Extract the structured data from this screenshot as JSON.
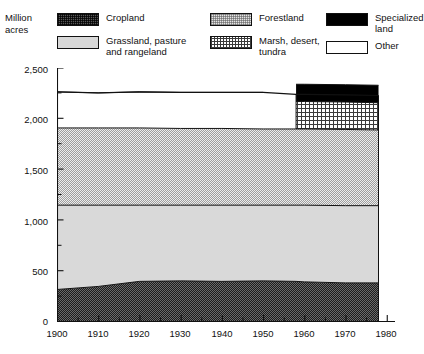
{
  "axis": {
    "unit_label": "Million\nacres",
    "y_ticks": [
      "2,500",
      "2,000",
      "1,500",
      "1,000",
      "500",
      "0"
    ],
    "x_ticks": [
      "1900",
      "1910",
      "1920",
      "1930",
      "1940",
      "1950",
      "1960",
      "1970",
      "1980"
    ]
  },
  "legend": {
    "items": [
      {
        "key": "cropland",
        "label": "Cropland",
        "swatch": "cropland-swatch"
      },
      {
        "key": "grassland",
        "label": "Grassland, pasture\nand rangeland",
        "swatch": "grassland-swatch"
      },
      {
        "key": "forestland",
        "label": "Forestland",
        "swatch": "forestland-swatch"
      },
      {
        "key": "marsh",
        "label": "Marsh, desert,\ntundra",
        "swatch": "marsh-swatch"
      },
      {
        "key": "specialized",
        "label": "Specialized\nland",
        "swatch": "specialized-land-swatch"
      },
      {
        "key": "other",
        "label": "Other",
        "swatch": "other-swatch"
      }
    ]
  },
  "colors": {
    "cropland": "#585858",
    "grassland": "#d8d8d8",
    "forestland": "#e4e4e4",
    "marsh": "#ffffff",
    "specialized": "#000000",
    "other": "#ffffff",
    "axis": "#111111"
  },
  "chart_data": {
    "type": "area",
    "title": "",
    "xlabel": "",
    "ylabel": "Million acres",
    "xlim": [
      1900,
      1982
    ],
    "ylim": [
      0,
      2500
    ],
    "ytick_values": [
      0,
      500,
      1000,
      1500,
      2000,
      2500
    ],
    "ytick_minor_step": 250,
    "xtick_values": [
      1900,
      1910,
      1920,
      1930,
      1940,
      1950,
      1960,
      1970,
      1980
    ],
    "xtick_minor_step": 5,
    "grid": false,
    "legend_position": "top",
    "stacking": "bottom-up",
    "data_end_year": 1978,
    "x": [
      1900,
      1910,
      1920,
      1930,
      1940,
      1950,
      1958,
      1960,
      1970,
      1978
    ],
    "series": [
      {
        "name": "Cropland",
        "values": [
          320,
          350,
          400,
          405,
          400,
          405,
          400,
          395,
          385,
          385
        ]
      },
      {
        "name": "Grassland, pasture and rangeland",
        "values": [
          830,
          800,
          750,
          745,
          750,
          745,
          750,
          755,
          760,
          760
        ]
      },
      {
        "name": "Forestland",
        "values": [
          760,
          760,
          760,
          755,
          755,
          750,
          750,
          750,
          750,
          745
        ]
      },
      {
        "name": "Marsh, desert, tundra",
        "values": [
          0,
          0,
          0,
          0,
          0,
          0,
          270,
          270,
          270,
          268
        ]
      },
      {
        "name": "Specialized land",
        "values": [
          0,
          0,
          0,
          0,
          0,
          0,
          170,
          170,
          170,
          172
        ]
      },
      {
        "name": "Other",
        "values": [
          355,
          345,
          355,
          355,
          355,
          360,
          0,
          0,
          0,
          0
        ]
      }
    ],
    "totals": [
      2265,
      2255,
      2265,
      2260,
      2260,
      2260,
      2240,
      2240,
      2235,
      2230
    ]
  }
}
